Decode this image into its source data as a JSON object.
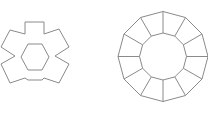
{
  "figure": {
    "background": "#ffffff",
    "stroke_color": "#8a8a8a",
    "shapes": [
      {
        "name": "six-armed-star-with-hexagon-hole",
        "outline_points": "25,22 44,22 44,34 59,29 69,47 55,56 69,64 59,83 44,78 42,80 28,80 25,78 10,83 1,64 15,56 1,47 10,30 25,34",
        "inner_hexagon_points": "28,44 42,44 49,57 42,70 28,70 21,57"
      },
      {
        "name": "dodecagonal-ring-with-spokes",
        "center": [
          163,
          56.5
        ],
        "outer_radius": 45,
        "inner_radius": 23.5,
        "sides": 12
      }
    ]
  }
}
